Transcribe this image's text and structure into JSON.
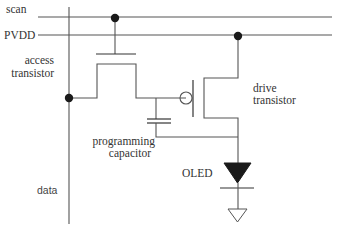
{
  "diagram": {
    "type": "circuit-schematic",
    "labels": {
      "scan": "scan",
      "pvdd": "PVDD",
      "access_line1": "access",
      "access_line2": "transistor",
      "drive_line1": "drive",
      "drive_line2": "transistor",
      "prog_line1": "programming",
      "prog_line2": "capacitor",
      "oled": "OLED",
      "data": "data"
    },
    "components": [
      {
        "id": "scan-line",
        "kind": "bus",
        "label": "scan"
      },
      {
        "id": "pvdd-line",
        "kind": "bus",
        "label": "PVDD"
      },
      {
        "id": "data-line",
        "kind": "bus",
        "label": "data"
      },
      {
        "id": "access-transistor",
        "kind": "nmos-tft",
        "label": "access transistor"
      },
      {
        "id": "drive-transistor",
        "kind": "pmos-tft",
        "label": "drive transistor"
      },
      {
        "id": "programming-capacitor",
        "kind": "capacitor",
        "label": "programming capacitor"
      },
      {
        "id": "oled",
        "kind": "diode",
        "label": "OLED"
      },
      {
        "id": "ground",
        "kind": "ground"
      }
    ],
    "colors": {
      "wire": "#555555",
      "junction": "#1a1a1a",
      "text": "#333333",
      "background": "#ffffff"
    }
  }
}
